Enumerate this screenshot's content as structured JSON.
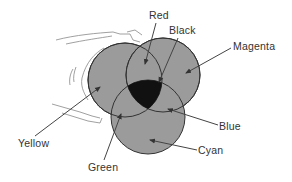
{
  "diagram": {
    "type": "subtractive-color-venn",
    "colors": {
      "circle_fill": "#9b9b9b",
      "circle_stroke": "#333333",
      "black_fill": "#111111",
      "line": "#444444",
      "sketch_line": "#888888"
    },
    "circles": [
      {
        "name": "Yellow",
        "cx": 125,
        "cy": 80,
        "r": 37
      },
      {
        "name": "Magenta",
        "cx": 163,
        "cy": 75,
        "r": 37
      },
      {
        "name": "Cyan",
        "cx": 148,
        "cy": 117,
        "r": 37
      }
    ],
    "labels": {
      "red": "Red",
      "black": "Black",
      "magenta": "Magenta",
      "yellow": "Yellow",
      "blue": "Blue",
      "green": "Green",
      "cyan": "Cyan"
    }
  }
}
